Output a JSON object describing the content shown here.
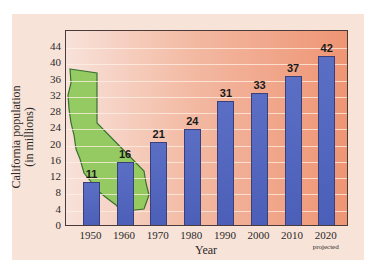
{
  "chart_data": {
    "type": "bar",
    "title": "",
    "xlabel": "Year",
    "ylabel": "California population (in millions)",
    "ylabel_lines": [
      "California population",
      "(in millions)"
    ],
    "categories": [
      "1950",
      "1960",
      "1970",
      "1980",
      "1990",
      "2000",
      "2010",
      "2020"
    ],
    "category_notes": {
      "2020": "projected"
    },
    "values": [
      11,
      16,
      21,
      24,
      31,
      33,
      37,
      42
    ],
    "value_labels": [
      "11",
      "16",
      "21",
      "24",
      "31",
      "33",
      "37",
      "42"
    ],
    "ylim": [
      0,
      46
    ],
    "yticks": [
      "0",
      "4",
      "8",
      "12",
      "16",
      "20",
      "24",
      "28",
      "32",
      "36",
      "40",
      "44"
    ],
    "grid": true,
    "legend": null,
    "annotations": [
      "Silhouette of the state of California overlaid behind bars 1950–1970"
    ],
    "colors": {
      "bar": "#5a6fc4",
      "bar_border": "#3a3f7a",
      "plot_bg_left": "#f8e2da",
      "plot_bg_right": "#ee9574",
      "panel_bg": "#f8e3d8",
      "state_fill": "#8fca5c",
      "state_edge": "#2f6b2a"
    }
  }
}
